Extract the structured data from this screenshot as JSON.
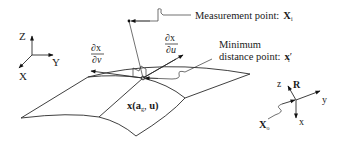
{
  "global_axes": {
    "z_label": "Z",
    "y_label": "Y",
    "x_label": "X"
  },
  "measurement_point": {
    "label": "Measurement point:",
    "symbol": "X",
    "subscript": "i"
  },
  "minimum_distance_point": {
    "label_line1": "Minimum",
    "label_line2": "distance point:",
    "symbol": "x",
    "prime": "′",
    "subscript": "i"
  },
  "tangent_u": {
    "numerator": "∂x",
    "denominator": "∂u"
  },
  "tangent_v": {
    "numerator": "∂x",
    "denominator": "∂v"
  },
  "surface_label": {
    "func": "x(",
    "a": "a",
    "a_sub": "g",
    "sep": ", ",
    "u": "u",
    "close": ")"
  },
  "local_frame": {
    "z_label": "z",
    "rotation_label": "R",
    "y_label": "y",
    "x_label": "x",
    "origin_symbol": "X",
    "origin_subscript": "o"
  }
}
